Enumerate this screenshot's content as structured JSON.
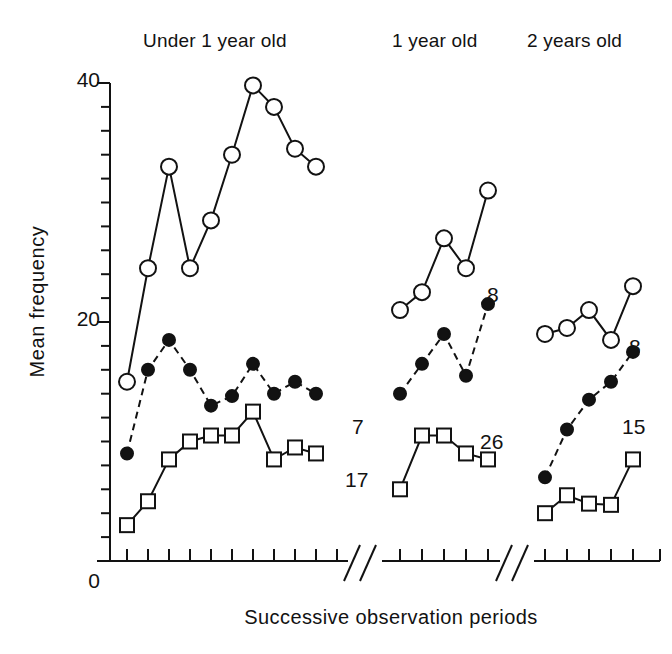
{
  "chart_data": {
    "type": "line",
    "title": "",
    "xlabel": "Successive observation periods",
    "ylabel": "Mean frequency",
    "ylim": [
      0,
      40
    ],
    "yticks_major": [
      0,
      20,
      40
    ],
    "ytick_interval_minor": 2,
    "grid": false,
    "legend_position": "end-of-line labels",
    "axis_breaks": true,
    "panels": [
      {
        "label": "Under 1 year old",
        "x": [
          1,
          2,
          3,
          4,
          5,
          6,
          7,
          8,
          9,
          10,
          11
        ],
        "series": [
          {
            "name": "open-circle",
            "marker": "open-circle",
            "linestyle": "solid",
            "end_label": "",
            "values": [
              15,
              24.5,
              33,
              24.5,
              28.5,
              34,
              39.8,
              38,
              34.5,
              33,
              null
            ]
          },
          {
            "name": "filled-circle",
            "marker": "filled-circle",
            "linestyle": "dashed",
            "end_label": "7",
            "values": [
              9,
              16,
              18.5,
              16,
              13,
              13.8,
              16.5,
              14,
              15,
              14,
              null
            ]
          },
          {
            "name": "open-square",
            "marker": "open-square",
            "linestyle": "solid",
            "end_label": "17",
            "values": [
              3,
              5,
              8.5,
              10,
              10.5,
              10.5,
              12.5,
              8.5,
              9.5,
              9,
              null
            ]
          }
        ]
      },
      {
        "label": "1 year old",
        "x": [
          1,
          2,
          3,
          4,
          5
        ],
        "series": [
          {
            "name": "open-circle",
            "marker": "open-circle",
            "linestyle": "solid",
            "end_label": "",
            "values": [
              21,
              22.5,
              27,
              24.5,
              31
            ]
          },
          {
            "name": "filled-circle",
            "marker": "filled-circle",
            "linestyle": "dashed",
            "end_label": "8",
            "values": [
              14,
              16.5,
              19,
              15.5,
              21.5
            ]
          },
          {
            "name": "open-square",
            "marker": "open-square",
            "linestyle": "solid",
            "end_label": "26",
            "values": [
              6,
              10.5,
              10.5,
              9,
              8.5
            ]
          }
        ]
      },
      {
        "label": "2 years old",
        "x": [
          1,
          2,
          3,
          4,
          5
        ],
        "series": [
          {
            "name": "open-circle",
            "marker": "open-circle",
            "linestyle": "solid",
            "end_label": "",
            "values": [
              19,
              19.5,
              21,
              18.5,
              23
            ]
          },
          {
            "name": "filled-circle",
            "marker": "filled-circle",
            "linestyle": "dashed",
            "end_label": "8",
            "values": [
              7,
              11,
              13.5,
              15,
              17.5
            ]
          },
          {
            "name": "open-square",
            "marker": "open-square",
            "linestyle": "solid",
            "end_label": "15",
            "values": [
              4,
              5.5,
              4.8,
              4.7,
              8.5
            ]
          }
        ]
      }
    ]
  },
  "axis": {
    "y_title": "Mean frequency",
    "x_title": "Successive observation periods",
    "ytick_40": "40",
    "ytick_20": "20",
    "ytick_0": "0"
  },
  "panel_titles": {
    "p0": "Under 1 year old",
    "p1": "1 year old",
    "p2": "2 years old"
  },
  "end_labels": {
    "p0_filled": "7",
    "p0_square": "17",
    "p1_filled": "8",
    "p1_square": "26",
    "p2_filled": "8",
    "p2_square": "15"
  },
  "colors": {
    "ink": "#121212",
    "background": "#ffffff"
  }
}
